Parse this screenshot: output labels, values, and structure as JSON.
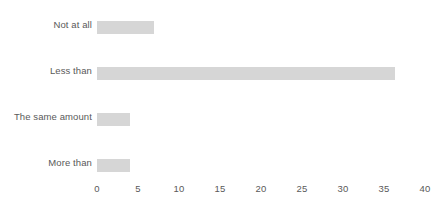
{
  "chart_data": {
    "type": "bar",
    "orientation": "horizontal",
    "title": "",
    "subtitle": "",
    "xlabel": "",
    "ylabel": "",
    "categories": [
      "Not at all",
      "Less than",
      "The same amount",
      "More than"
    ],
    "values": [
      7,
      36.3,
      4,
      4
    ],
    "series": [
      {
        "name": "",
        "values": [
          7,
          36.3,
          4,
          4
        ]
      }
    ],
    "xlim": [
      0,
      40
    ],
    "ylim": null,
    "xticks": [
      0,
      5,
      10,
      15,
      20,
      25,
      30,
      35,
      40
    ],
    "xtick_labels": [
      "0",
      "5",
      "10",
      "15",
      "20",
      "25",
      "30",
      "35",
      "40"
    ],
    "grid": false,
    "legend": false,
    "legend_position": "none",
    "bar_color": "#d6d6d6",
    "text_color": "#595959",
    "background_color": "#ffffff",
    "annotations": []
  },
  "bars": [
    {
      "label": "Not at all",
      "value": 7,
      "top": 21,
      "label_top": 19,
      "width_px": 57,
      "color": "#d6d6d6"
    },
    {
      "label": "Less than",
      "value": 36.3,
      "top": 67,
      "label_top": 65,
      "width_px": 298,
      "color": "#d6d6d6"
    },
    {
      "label": "The same amount",
      "value": 4,
      "top": 113,
      "label_top": 111,
      "width_px": 33,
      "color": "#d6d6d6"
    },
    {
      "label": "More than",
      "value": 4,
      "top": 159,
      "label_top": 157,
      "width_px": 33,
      "color": "#d6d6d6"
    }
  ],
  "axis": {
    "ticks": [
      {
        "label": "0",
        "x": 97
      },
      {
        "label": "5",
        "x": 138
      },
      {
        "label": "10",
        "x": 179
      },
      {
        "label": "15",
        "x": 220
      },
      {
        "label": "20",
        "x": 261
      },
      {
        "label": "25",
        "x": 302
      },
      {
        "label": "30",
        "x": 343
      },
      {
        "label": "35",
        "x": 384
      },
      {
        "label": "40",
        "x": 425
      }
    ]
  }
}
